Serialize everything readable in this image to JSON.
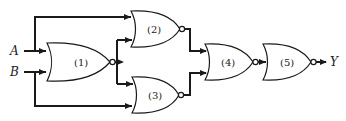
{
  "diagram": {
    "type": "logic-circuit",
    "inputs": [
      {
        "name": "A"
      },
      {
        "name": "B"
      }
    ],
    "output": {
      "name": "Y"
    },
    "gates": [
      {
        "id": "1",
        "label": "(1)",
        "type": "NOR",
        "inputs": [
          "A",
          "B"
        ]
      },
      {
        "id": "2",
        "label": "(2)",
        "type": "NOR",
        "inputs": [
          "A",
          "1"
        ]
      },
      {
        "id": "3",
        "label": "(3)",
        "type": "NOR",
        "inputs": [
          "1",
          "B"
        ]
      },
      {
        "id": "4",
        "label": "(4)",
        "type": "NOR",
        "inputs": [
          "2",
          "3"
        ]
      },
      {
        "id": "5",
        "label": "(5)",
        "type": "NOR",
        "inputs": [
          "4"
        ]
      }
    ],
    "colors": {
      "line": "#1a1a1a",
      "background": "#ffffff"
    }
  }
}
